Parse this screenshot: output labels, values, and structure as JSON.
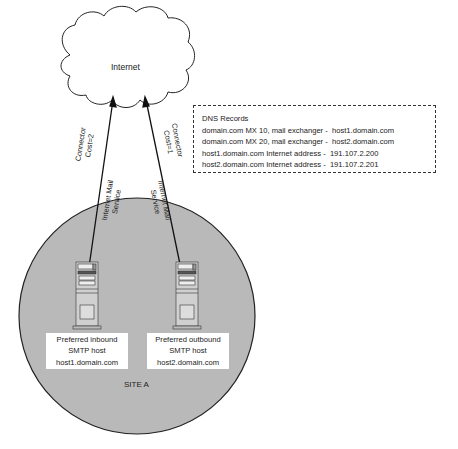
{
  "cloud": {
    "label": "Internet"
  },
  "dns": {
    "title": "DNS Records",
    "records": [
      "domain.com MX 10, mail exchanger -  host1.domain.com",
      "domain.com MX 20, mail exchanger -  host2.domain.com",
      "host1.domain.com Internet address -  191.107.2.200",
      "host2.domain.com Internet address -  191.107.2.201"
    ]
  },
  "links": [
    {
      "connector": "Connector",
      "cost": "Cost=2",
      "service1": "Internet Mail",
      "service2": "Service"
    },
    {
      "connector": "Connector",
      "cost": "Cost=1",
      "service1": "Internet Mail",
      "service2": "Service"
    }
  ],
  "hosts": [
    {
      "line1": "Preferred inbound",
      "line2": "SMTP host",
      "line3": "host1.domain.com"
    },
    {
      "line1": "Preferred outbound",
      "line2": "SMTP host",
      "line3": "host2.domain.com"
    }
  ],
  "site": {
    "label": "SITE A"
  },
  "colors": {
    "site_fill": "#b9b9b9",
    "line": "#222222"
  }
}
